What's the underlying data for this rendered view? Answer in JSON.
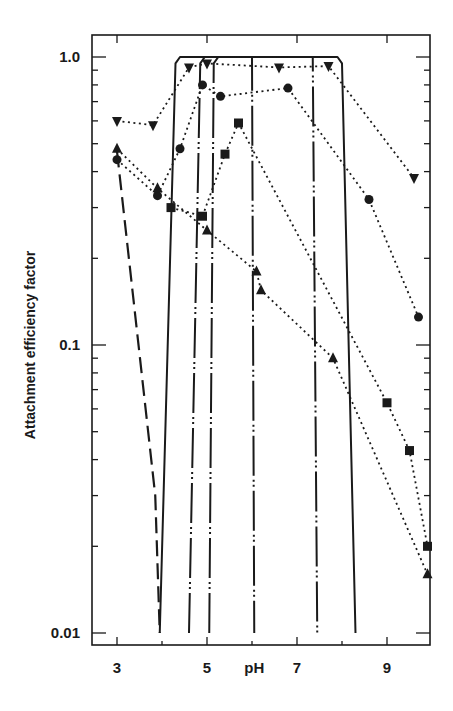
{
  "chart_data": {
    "type": "line",
    "title": "",
    "xlabel": "pH",
    "ylabel": "Attachment efficiency factor",
    "yscale": "log",
    "xlim": [
      2.45,
      10.0
    ],
    "ylim": [
      0.0095,
      1.2
    ],
    "x_ticks": [
      3,
      5,
      7,
      9
    ],
    "x_tick_labels": [
      "3",
      "5",
      "pH",
      "7",
      "9"
    ],
    "y_ticks": [
      0.01,
      0.1,
      1.0
    ],
    "y_tick_labels": [
      "0.01",
      "0.1",
      "1.0"
    ],
    "grid": false,
    "legend": "none",
    "series": [
      {
        "name": "inverted-triangle",
        "marker": "inverted-triangle",
        "line_style": "dotted",
        "x": [
          3.0,
          3.8,
          4.6,
          5.0,
          6.6,
          7.7,
          9.6
        ],
        "values": [
          0.6,
          0.58,
          0.92,
          0.95,
          0.92,
          0.93,
          0.38
        ]
      },
      {
        "name": "circle",
        "marker": "circle",
        "line_style": "dotted",
        "x": [
          3.0,
          3.9,
          4.4,
          4.9,
          5.3,
          6.8,
          8.6,
          9.7
        ],
        "values": [
          0.44,
          0.33,
          0.48,
          0.8,
          0.73,
          0.78,
          0.32,
          0.125
        ]
      },
      {
        "name": "triangle",
        "marker": "triangle",
        "line_style": "dotted",
        "x": [
          3.0,
          3.9,
          5.0,
          6.1,
          6.2,
          7.8,
          9.9
        ],
        "values": [
          0.48,
          0.35,
          0.25,
          0.18,
          0.155,
          0.09,
          0.016
        ]
      },
      {
        "name": "square",
        "marker": "square",
        "line_style": "dotted",
        "x": [
          4.2,
          4.9,
          5.4,
          5.7,
          9.0,
          9.5,
          9.9
        ],
        "values": [
          0.3,
          0.28,
          0.46,
          0.59,
          0.063,
          0.043,
          0.02
        ]
      }
    ],
    "curves": [
      {
        "name": "long-dash-curve",
        "line_style": "long-dash",
        "x": [
          3.0,
          3.85,
          3.95
        ],
        "values": [
          0.47,
          0.03,
          0.01
        ]
      },
      {
        "name": "solid-envelope",
        "line_style": "solid",
        "x": [
          3.95,
          4.3,
          4.4,
          7.9,
          8.0,
          8.3
        ],
        "values": [
          0.01,
          0.95,
          1.0,
          1.0,
          0.95,
          0.01
        ]
      },
      {
        "name": "dash-dot-1",
        "line_style": "dash-dot-dot",
        "x": [
          4.6,
          4.85,
          4.95,
          7.35,
          7.45
        ],
        "values": [
          0.01,
          0.95,
          1.0,
          1.0,
          0.01
        ]
      },
      {
        "name": "dash-dot-2",
        "line_style": "dash-dot-dot",
        "x": [
          5.05,
          5.15,
          5.25,
          6.0,
          6.05
        ],
        "values": [
          0.01,
          0.95,
          1.0,
          1.0,
          0.01
        ]
      }
    ]
  }
}
